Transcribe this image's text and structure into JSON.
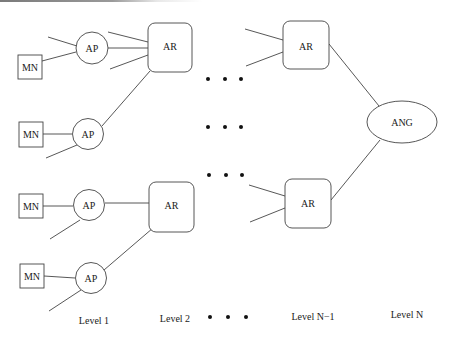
{
  "diagram": {
    "type": "hierarchical network topology",
    "nodes": {
      "mn": [
        {
          "id": "mn1",
          "label": "MN"
        },
        {
          "id": "mn2",
          "label": "MN"
        },
        {
          "id": "mn3",
          "label": "MN"
        },
        {
          "id": "mn4",
          "label": "MN"
        }
      ],
      "ap": [
        {
          "id": "ap1",
          "label": "AP"
        },
        {
          "id": "ap2",
          "label": "AP"
        },
        {
          "id": "ap3",
          "label": "AP"
        },
        {
          "id": "ap4",
          "label": "AP"
        }
      ],
      "ar": [
        {
          "id": "ar1",
          "label": "AR",
          "level": "Level 2"
        },
        {
          "id": "ar2",
          "label": "AR",
          "level": "Level 2"
        },
        {
          "id": "ar3",
          "label": "AR",
          "level": "Level N-1"
        },
        {
          "id": "ar4",
          "label": "AR",
          "level": "Level N-1"
        }
      ],
      "ang": {
        "id": "ang",
        "label": "ANG",
        "level": "Level N"
      }
    },
    "edges": [
      [
        "mn1",
        "ap1"
      ],
      [
        "ap1",
        "ar1"
      ],
      [
        "mn2",
        "ap2"
      ],
      [
        "ap2",
        "ar1"
      ],
      [
        "mn3",
        "ap3"
      ],
      [
        "ap3",
        "ar2"
      ],
      [
        "mn4",
        "ap4"
      ],
      [
        "ap4",
        "ar2"
      ],
      [
        "ar3",
        "ang"
      ],
      [
        "ar4",
        "ang"
      ]
    ],
    "ellipsis": "• • •",
    "levels": [
      {
        "label": "Level 1"
      },
      {
        "label": "Level 2"
      },
      {
        "label": "• • •"
      },
      {
        "label": "Level N−1"
      },
      {
        "label": "Level N"
      }
    ]
  }
}
